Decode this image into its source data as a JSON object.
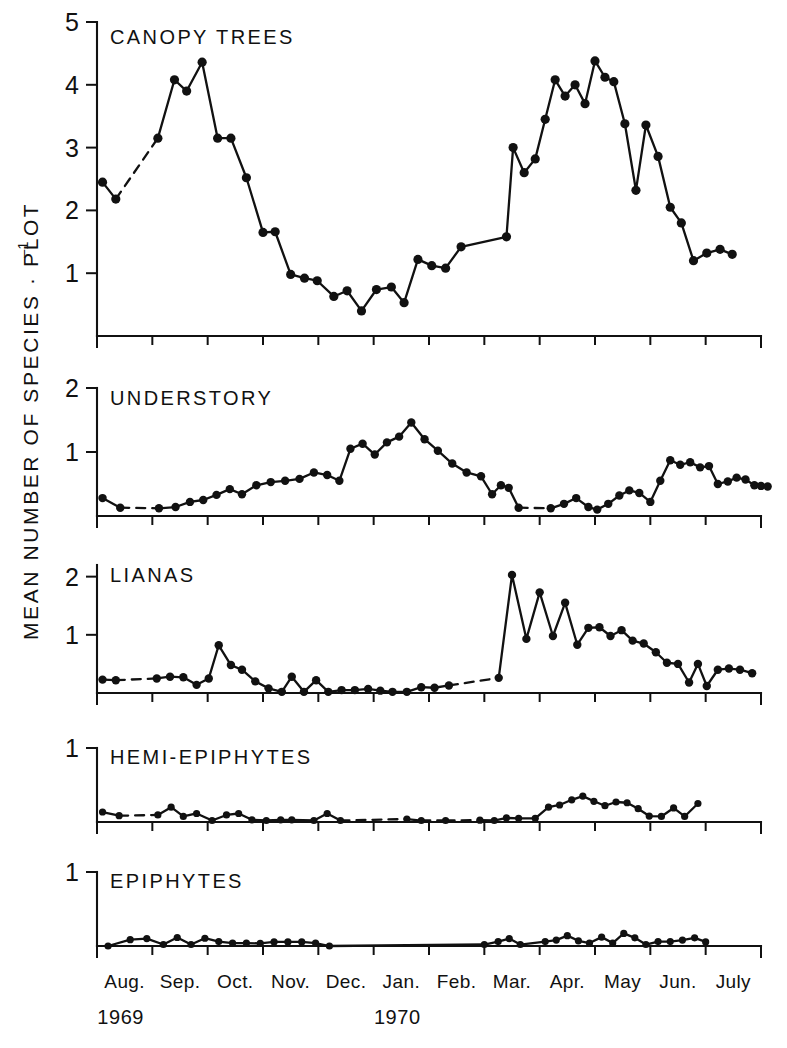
{
  "figure": {
    "y_axis_label": "MEAN NUMBER OF SPECIES · PLOT",
    "y_axis_label_exponent": "–1",
    "background_color": "#ffffff",
    "ink_color": "#111111"
  },
  "x_axis": {
    "month_labels": [
      "Aug.",
      "Sep.",
      "Oct.",
      "Nov.",
      "Dec.",
      "Jan.",
      "Feb.",
      "Mar.",
      "Apr.",
      "May",
      "Jun.",
      "July"
    ],
    "year_labels": [
      {
        "text": "1969",
        "month_index": 0
      },
      {
        "text": "1970",
        "month_index": 5
      }
    ],
    "range_start": "Aug. 1969",
    "range_end": "July 1970"
  },
  "chart_data": {
    "type": "line",
    "xlabel": "",
    "ylabel": "MEAN NUMBER OF SPECIES · PLOT⁻¹",
    "x_unit": "month",
    "x": [
      "Aug.",
      "Sep.",
      "Oct.",
      "Nov.",
      "Dec.",
      "Jan.",
      "Feb.",
      "Mar.",
      "Apr.",
      "May",
      "Jun.",
      "July"
    ],
    "grid": false,
    "legend": "panel-titles",
    "marker": "filled-circle",
    "gap_style": "dashed-line",
    "panels": [
      {
        "title": "CANOPY TREES",
        "ylim": [
          0,
          5
        ],
        "yticks": [
          1,
          2,
          3,
          4,
          5
        ],
        "points": [
          {
            "t": 0.1,
            "v": 2.45
          },
          {
            "t": 0.34,
            "v": 2.18
          },
          {
            "t": 1.1,
            "v": 3.15
          },
          {
            "t": 1.4,
            "v": 4.08
          },
          {
            "t": 1.62,
            "v": 3.9
          },
          {
            "t": 1.9,
            "v": 4.36
          },
          {
            "t": 2.18,
            "v": 3.15
          },
          {
            "t": 2.42,
            "v": 3.15
          },
          {
            "t": 2.7,
            "v": 2.52
          },
          {
            "t": 3.0,
            "v": 1.65
          },
          {
            "t": 3.22,
            "v": 1.66
          },
          {
            "t": 3.5,
            "v": 0.98
          },
          {
            "t": 3.75,
            "v": 0.92
          },
          {
            "t": 3.98,
            "v": 0.88
          },
          {
            "t": 4.28,
            "v": 0.63
          },
          {
            "t": 4.52,
            "v": 0.72
          },
          {
            "t": 4.78,
            "v": 0.4
          },
          {
            "t": 5.05,
            "v": 0.74
          },
          {
            "t": 5.32,
            "v": 0.78
          },
          {
            "t": 5.55,
            "v": 0.53
          },
          {
            "t": 5.8,
            "v": 1.22
          },
          {
            "t": 6.05,
            "v": 1.12
          },
          {
            "t": 6.3,
            "v": 1.08
          },
          {
            "t": 6.58,
            "v": 1.42
          },
          {
            "t": 7.4,
            "v": 1.58
          },
          {
            "t": 7.52,
            "v": 3.0
          },
          {
            "t": 7.72,
            "v": 2.6
          },
          {
            "t": 7.92,
            "v": 2.82
          },
          {
            "t": 8.1,
            "v": 3.45
          },
          {
            "t": 8.28,
            "v": 4.08
          },
          {
            "t": 8.46,
            "v": 3.82
          },
          {
            "t": 8.64,
            "v": 4.0
          },
          {
            "t": 8.82,
            "v": 3.7
          },
          {
            "t": 9.0,
            "v": 4.38
          },
          {
            "t": 9.18,
            "v": 4.12
          },
          {
            "t": 9.34,
            "v": 4.05
          },
          {
            "t": 9.54,
            "v": 3.38
          },
          {
            "t": 9.74,
            "v": 2.32
          },
          {
            "t": 9.92,
            "v": 3.36
          },
          {
            "t": 10.14,
            "v": 2.86
          },
          {
            "t": 10.36,
            "v": 2.05
          },
          {
            "t": 10.56,
            "v": 1.8
          },
          {
            "t": 10.78,
            "v": 1.2
          },
          {
            "t": 11.02,
            "v": 1.32
          },
          {
            "t": 11.26,
            "v": 1.38
          },
          {
            "t": 11.48,
            "v": 1.3
          }
        ],
        "dashed_segments": [
          [
            1,
            2
          ]
        ]
      },
      {
        "title": "UNDERSTORY",
        "ylim": [
          0,
          2
        ],
        "yticks": [
          1,
          2
        ],
        "points": [
          {
            "t": 0.1,
            "v": 0.28
          },
          {
            "t": 0.42,
            "v": 0.13
          },
          {
            "t": 1.12,
            "v": 0.12
          },
          {
            "t": 1.42,
            "v": 0.14
          },
          {
            "t": 1.68,
            "v": 0.22
          },
          {
            "t": 1.92,
            "v": 0.25
          },
          {
            "t": 2.16,
            "v": 0.33
          },
          {
            "t": 2.4,
            "v": 0.42
          },
          {
            "t": 2.62,
            "v": 0.34
          },
          {
            "t": 2.88,
            "v": 0.48
          },
          {
            "t": 3.14,
            "v": 0.53
          },
          {
            "t": 3.4,
            "v": 0.55
          },
          {
            "t": 3.66,
            "v": 0.58
          },
          {
            "t": 3.92,
            "v": 0.68
          },
          {
            "t": 4.16,
            "v": 0.64
          },
          {
            "t": 4.38,
            "v": 0.55
          },
          {
            "t": 4.58,
            "v": 1.05
          },
          {
            "t": 4.8,
            "v": 1.13
          },
          {
            "t": 5.02,
            "v": 0.96
          },
          {
            "t": 5.24,
            "v": 1.15
          },
          {
            "t": 5.46,
            "v": 1.24
          },
          {
            "t": 5.68,
            "v": 1.46
          },
          {
            "t": 5.92,
            "v": 1.2
          },
          {
            "t": 6.16,
            "v": 1.02
          },
          {
            "t": 6.42,
            "v": 0.82
          },
          {
            "t": 6.68,
            "v": 0.68
          },
          {
            "t": 6.94,
            "v": 0.62
          },
          {
            "t": 7.14,
            "v": 0.34
          },
          {
            "t": 7.3,
            "v": 0.48
          },
          {
            "t": 7.44,
            "v": 0.44
          },
          {
            "t": 7.62,
            "v": 0.13
          },
          {
            "t": 8.2,
            "v": 0.12
          },
          {
            "t": 8.44,
            "v": 0.19
          },
          {
            "t": 8.66,
            "v": 0.28
          },
          {
            "t": 8.88,
            "v": 0.14
          },
          {
            "t": 9.04,
            "v": 0.1
          },
          {
            "t": 9.24,
            "v": 0.19
          },
          {
            "t": 9.44,
            "v": 0.32
          },
          {
            "t": 9.62,
            "v": 0.4
          },
          {
            "t": 9.8,
            "v": 0.36
          },
          {
            "t": 10.0,
            "v": 0.22
          },
          {
            "t": 10.18,
            "v": 0.55
          },
          {
            "t": 10.36,
            "v": 0.87
          },
          {
            "t": 10.54,
            "v": 0.8
          },
          {
            "t": 10.72,
            "v": 0.84
          },
          {
            "t": 10.9,
            "v": 0.76
          },
          {
            "t": 11.06,
            "v": 0.78
          },
          {
            "t": 11.22,
            "v": 0.5
          },
          {
            "t": 11.4,
            "v": 0.54
          },
          {
            "t": 11.56,
            "v": 0.6
          },
          {
            "t": 11.72,
            "v": 0.57
          },
          {
            "t": 11.88,
            "v": 0.48
          },
          {
            "t": 12.0,
            "v": 0.47
          },
          {
            "t": 12.12,
            "v": 0.46
          }
        ],
        "dashed_segments": [
          [
            1,
            2
          ],
          [
            30,
            31
          ]
        ]
      },
      {
        "title": "LIANAS",
        "ylim": [
          0,
          2.2
        ],
        "yticks": [
          1,
          2
        ],
        "points": [
          {
            "t": 0.1,
            "v": 0.23
          },
          {
            "t": 0.34,
            "v": 0.22
          },
          {
            "t": 1.08,
            "v": 0.25
          },
          {
            "t": 1.32,
            "v": 0.28
          },
          {
            "t": 1.56,
            "v": 0.27
          },
          {
            "t": 1.8,
            "v": 0.14
          },
          {
            "t": 2.02,
            "v": 0.25
          },
          {
            "t": 2.2,
            "v": 0.82
          },
          {
            "t": 2.42,
            "v": 0.48
          },
          {
            "t": 2.62,
            "v": 0.4
          },
          {
            "t": 2.86,
            "v": 0.2
          },
          {
            "t": 3.1,
            "v": 0.08
          },
          {
            "t": 3.34,
            "v": 0.02
          },
          {
            "t": 3.52,
            "v": 0.28
          },
          {
            "t": 3.74,
            "v": 0.02
          },
          {
            "t": 3.96,
            "v": 0.22
          },
          {
            "t": 4.18,
            "v": 0.02
          },
          {
            "t": 4.42,
            "v": 0.05
          },
          {
            "t": 4.66,
            "v": 0.05
          },
          {
            "t": 4.9,
            "v": 0.07
          },
          {
            "t": 5.12,
            "v": 0.04
          },
          {
            "t": 5.34,
            "v": 0.02
          },
          {
            "t": 5.6,
            "v": 0.02
          },
          {
            "t": 5.86,
            "v": 0.1
          },
          {
            "t": 6.1,
            "v": 0.09
          },
          {
            "t": 6.36,
            "v": 0.13
          },
          {
            "t": 7.26,
            "v": 0.26
          },
          {
            "t": 7.5,
            "v": 2.03
          },
          {
            "t": 7.76,
            "v": 0.93
          },
          {
            "t": 8.0,
            "v": 1.73
          },
          {
            "t": 8.24,
            "v": 0.98
          },
          {
            "t": 8.46,
            "v": 1.55
          },
          {
            "t": 8.68,
            "v": 0.83
          },
          {
            "t": 8.88,
            "v": 1.12
          },
          {
            "t": 9.08,
            "v": 1.13
          },
          {
            "t": 9.28,
            "v": 0.98
          },
          {
            "t": 9.48,
            "v": 1.08
          },
          {
            "t": 9.68,
            "v": 0.9
          },
          {
            "t": 9.88,
            "v": 0.85
          },
          {
            "t": 10.1,
            "v": 0.7
          },
          {
            "t": 10.3,
            "v": 0.52
          },
          {
            "t": 10.5,
            "v": 0.5
          },
          {
            "t": 10.7,
            "v": 0.18
          },
          {
            "t": 10.86,
            "v": 0.5
          },
          {
            "t": 11.02,
            "v": 0.12
          },
          {
            "t": 11.22,
            "v": 0.4
          },
          {
            "t": 11.42,
            "v": 0.42
          },
          {
            "t": 11.62,
            "v": 0.4
          },
          {
            "t": 11.84,
            "v": 0.34
          }
        ],
        "dashed_segments": [
          [
            1,
            2
          ],
          [
            25,
            26
          ]
        ]
      },
      {
        "title": "HEMI-EPIPHYTES",
        "ylim": [
          0,
          1
        ],
        "yticks": [
          1
        ],
        "points": [
          {
            "t": 0.1,
            "v": 0.135
          },
          {
            "t": 0.4,
            "v": 0.085
          },
          {
            "t": 1.1,
            "v": 0.095
          },
          {
            "t": 1.34,
            "v": 0.2
          },
          {
            "t": 1.56,
            "v": 0.075
          },
          {
            "t": 1.8,
            "v": 0.115
          },
          {
            "t": 2.08,
            "v": 0.02
          },
          {
            "t": 2.34,
            "v": 0.095
          },
          {
            "t": 2.56,
            "v": 0.115
          },
          {
            "t": 2.8,
            "v": 0.03
          },
          {
            "t": 3.06,
            "v": 0.02
          },
          {
            "t": 3.32,
            "v": 0.03
          },
          {
            "t": 3.52,
            "v": 0.03
          },
          {
            "t": 3.92,
            "v": 0.02
          },
          {
            "t": 4.16,
            "v": 0.115
          },
          {
            "t": 4.4,
            "v": 0.02
          },
          {
            "t": 5.6,
            "v": 0.04
          },
          {
            "t": 5.86,
            "v": 0.02
          },
          {
            "t": 6.3,
            "v": 0.02
          },
          {
            "t": 6.92,
            "v": 0.025
          },
          {
            "t": 7.18,
            "v": 0.02
          },
          {
            "t": 7.4,
            "v": 0.055
          },
          {
            "t": 7.62,
            "v": 0.05
          },
          {
            "t": 7.92,
            "v": 0.05
          },
          {
            "t": 8.16,
            "v": 0.2
          },
          {
            "t": 8.36,
            "v": 0.23
          },
          {
            "t": 8.58,
            "v": 0.3
          },
          {
            "t": 8.78,
            "v": 0.35
          },
          {
            "t": 8.98,
            "v": 0.28
          },
          {
            "t": 9.18,
            "v": 0.22
          },
          {
            "t": 9.38,
            "v": 0.27
          },
          {
            "t": 9.58,
            "v": 0.26
          },
          {
            "t": 9.78,
            "v": 0.18
          },
          {
            "t": 9.98,
            "v": 0.08
          },
          {
            "t": 10.2,
            "v": 0.075
          },
          {
            "t": 10.42,
            "v": 0.19
          },
          {
            "t": 10.62,
            "v": 0.075
          },
          {
            "t": 10.86,
            "v": 0.25
          }
        ],
        "dashed_segments": [
          [
            1,
            2
          ],
          [
            15,
            16
          ],
          [
            17,
            18
          ],
          [
            18,
            19
          ]
        ]
      },
      {
        "title": "EPIPHYTES",
        "ylim": [
          0,
          1
        ],
        "yticks": [
          1
        ],
        "points": [
          {
            "t": 0.2,
            "v": 0.0
          },
          {
            "t": 0.6,
            "v": 0.085
          },
          {
            "t": 0.9,
            "v": 0.1
          },
          {
            "t": 1.2,
            "v": 0.02
          },
          {
            "t": 1.45,
            "v": 0.115
          },
          {
            "t": 1.7,
            "v": 0.02
          },
          {
            "t": 1.95,
            "v": 0.105
          },
          {
            "t": 2.2,
            "v": 0.06
          },
          {
            "t": 2.45,
            "v": 0.04
          },
          {
            "t": 2.7,
            "v": 0.04
          },
          {
            "t": 2.95,
            "v": 0.035
          },
          {
            "t": 3.2,
            "v": 0.055
          },
          {
            "t": 3.45,
            "v": 0.055
          },
          {
            "t": 3.7,
            "v": 0.055
          },
          {
            "t": 3.95,
            "v": 0.04
          },
          {
            "t": 4.2,
            "v": 0.0
          },
          {
            "t": 7.0,
            "v": 0.02
          },
          {
            "t": 7.25,
            "v": 0.06
          },
          {
            "t": 7.45,
            "v": 0.1
          },
          {
            "t": 7.65,
            "v": 0.02
          },
          {
            "t": 8.1,
            "v": 0.06
          },
          {
            "t": 8.3,
            "v": 0.08
          },
          {
            "t": 8.5,
            "v": 0.14
          },
          {
            "t": 8.7,
            "v": 0.07
          },
          {
            "t": 8.9,
            "v": 0.04
          },
          {
            "t": 9.12,
            "v": 0.12
          },
          {
            "t": 9.32,
            "v": 0.04
          },
          {
            "t": 9.52,
            "v": 0.17
          },
          {
            "t": 9.72,
            "v": 0.11
          },
          {
            "t": 9.92,
            "v": 0.02
          },
          {
            "t": 10.14,
            "v": 0.06
          },
          {
            "t": 10.36,
            "v": 0.06
          },
          {
            "t": 10.58,
            "v": 0.08
          },
          {
            "t": 10.8,
            "v": 0.11
          },
          {
            "t": 11.0,
            "v": 0.055
          }
        ],
        "dashed_segments": []
      }
    ]
  }
}
